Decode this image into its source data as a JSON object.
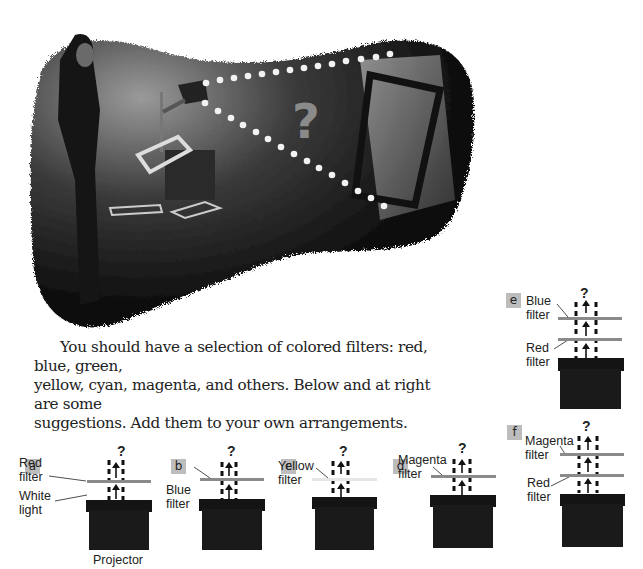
{
  "photo": {
    "description": "Woman placing filter on overhead projector; dotted beam projected onto screen",
    "overlay_symbol": "?"
  },
  "paragraph": {
    "lines": [
      "You should have a selection of colored filters: red, blue, green,",
      "yellow, cyan, magenta, and others. Below and at right are some",
      "suggestions. Add them to your own arrangements."
    ]
  },
  "colors": {
    "filter_gray": "#8a8a8a",
    "yellow_filter": "#e6e6e6",
    "projector": "#1a1a1a",
    "badge_bg": "#bdbdbd"
  },
  "panels": [
    {
      "id": "a",
      "badge": "a",
      "question": "?",
      "labels": [
        "Red filter",
        "White light"
      ],
      "label_lines": [
        [
          "Red",
          "filter"
        ],
        [
          "White",
          "light"
        ]
      ],
      "filters": [
        "Red filter"
      ],
      "caption": "Projector"
    },
    {
      "id": "b",
      "badge": "b",
      "question": "?",
      "label_lines": [
        [
          "Blue",
          "filter"
        ]
      ],
      "filters": [
        "Blue filter"
      ]
    },
    {
      "id": "c",
      "badge": "c",
      "question": "?",
      "label_lines": [
        [
          "Yellow",
          "filter"
        ]
      ],
      "filters": [
        "Yellow filter"
      ]
    },
    {
      "id": "d",
      "badge": "d",
      "question": "?",
      "label_lines": [
        [
          "Magenta",
          "filter"
        ]
      ],
      "filters": [
        "Magenta filter"
      ]
    },
    {
      "id": "e",
      "badge": "e",
      "question": "?",
      "label_lines": [
        [
          "Blue",
          "filter"
        ],
        [
          "Red",
          "filter"
        ]
      ],
      "filters": [
        "Blue filter",
        "Red filter"
      ]
    },
    {
      "id": "f",
      "badge": "f",
      "question": "?",
      "label_lines": [
        [
          "Magenta",
          "filter"
        ],
        [
          "Red",
          "filter"
        ]
      ],
      "filters": [
        "Magenta filter",
        "Red filter"
      ]
    }
  ]
}
